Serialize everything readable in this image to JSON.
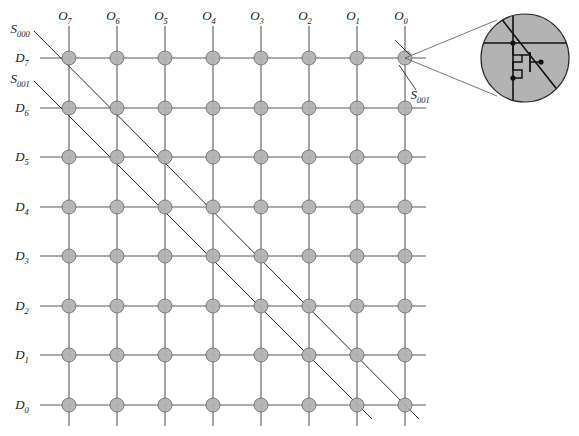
{
  "figure": {
    "type": "crossbar-memory-array-diagram",
    "background_color": "#ffffff"
  },
  "grid": {
    "columns": 8,
    "rows": 8,
    "column_x": [
      69,
      117,
      165,
      213,
      261,
      309,
      357,
      405
    ],
    "row_y": [
      58,
      108,
      157,
      207,
      256,
      306,
      355,
      405
    ],
    "line_color": "#5a5a5a",
    "node_fill": "#b3b3b3",
    "node_stroke": "#6e6e6e",
    "node_radius": 7,
    "col_line_top": 26,
    "col_line_bottom": 426,
    "row_line_left": 40,
    "row_line_right": 426
  },
  "column_labels": [
    {
      "base": "O",
      "sub": "7",
      "x": 69,
      "y": 20
    },
    {
      "base": "O",
      "sub": "6",
      "x": 117,
      "y": 20
    },
    {
      "base": "O",
      "sub": "5",
      "x": 165,
      "y": 20
    },
    {
      "base": "O",
      "sub": "4",
      "x": 213,
      "y": 20
    },
    {
      "base": "O",
      "sub": "3",
      "x": 261,
      "y": 20
    },
    {
      "base": "O",
      "sub": "2",
      "x": 309,
      "y": 20
    },
    {
      "base": "O",
      "sub": "1",
      "x": 357,
      "y": 20
    },
    {
      "base": "O",
      "sub": "0",
      "x": 405,
      "y": 20
    }
  ],
  "row_labels": [
    {
      "base": "D",
      "sub": "7",
      "x": 22,
      "y": 58
    },
    {
      "base": "D",
      "sub": "6",
      "x": 22,
      "y": 108
    },
    {
      "base": "D",
      "sub": "5",
      "x": 22,
      "y": 157
    },
    {
      "base": "D",
      "sub": "4",
      "x": 22,
      "y": 207
    },
    {
      "base": "D",
      "sub": "3",
      "x": 22,
      "y": 256
    },
    {
      "base": "D",
      "sub": "2",
      "x": 22,
      "y": 306
    },
    {
      "base": "D",
      "sub": "1",
      "x": 22,
      "y": 355
    },
    {
      "base": "D",
      "sub": "0",
      "x": 22,
      "y": 405
    }
  ],
  "diagonals": [
    {
      "name": "S000",
      "base": "S",
      "sub": "000",
      "x1": 34,
      "y1": 31,
      "x2": 419,
      "y2": 419,
      "label_x": 20,
      "label_y": 33
    },
    {
      "name": "S001",
      "base": "S",
      "sub": "001",
      "x1": 34,
      "y1": 81,
      "x2": 372,
      "y2": 419,
      "label_x": 20,
      "label_y": 83
    }
  ],
  "cell_pointer": {
    "base": "S",
    "sub": "001",
    "label_x": 420,
    "label_y": 99,
    "stub_x1": 416,
    "stub_y1": 90,
    "stub_x2": 399,
    "stub_y2": 65,
    "stub2_x1": 395,
    "stub2_y1": 40,
    "stub2_x2": 410,
    "stub2_y2": 55
  },
  "inset": {
    "label": "magnified-memory-cell",
    "circle_cx": 525,
    "circle_cy": 58,
    "circle_r": 44,
    "fill": "#b3b3b3",
    "stroke": "#2b2b2b",
    "callout_from_x": 405,
    "callout_from_y": 58,
    "callout_1_x": 497,
    "callout_1_y": 20,
    "callout_2_x": 497,
    "callout_2_y": 96,
    "schematic": {
      "vertical_line_x": 513,
      "vertical_line_y1": 16,
      "vertical_line_y2": 100,
      "horizontal_line_y": 43,
      "horizontal_line_x1": 484,
      "horizontal_line_x2": 566,
      "diagonal_x1": 500,
      "diagonal_y1": 17,
      "diagonal_x2": 559,
      "diagonal_y2": 92,
      "node_dots": [
        {
          "x": 513,
          "y": 43
        },
        {
          "x": 513,
          "y": 78
        },
        {
          "x": 541,
          "y": 62
        }
      ],
      "transistor_label": "mosfet-symbol"
    }
  }
}
